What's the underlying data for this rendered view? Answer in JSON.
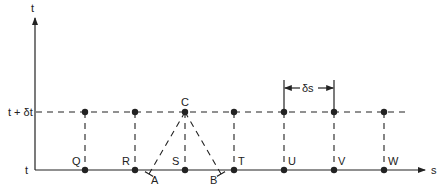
{
  "diagram": {
    "axes": {
      "vertical_label": "t",
      "horizontal_label": "s",
      "time_levels": {
        "lower": "t",
        "upper": "t + δt"
      }
    },
    "spacing_label": "δs",
    "apex_label": "C",
    "characteristic_feet": [
      {
        "label": "A"
      },
      {
        "label": "B"
      }
    ],
    "grid_points": [
      {
        "label": "Q"
      },
      {
        "label": "R"
      },
      {
        "label": "S"
      },
      {
        "label": "T"
      },
      {
        "label": "U"
      },
      {
        "label": "V"
      },
      {
        "label": "W"
      }
    ],
    "colors": {
      "ink": "#222222",
      "background": "#ffffff"
    }
  }
}
